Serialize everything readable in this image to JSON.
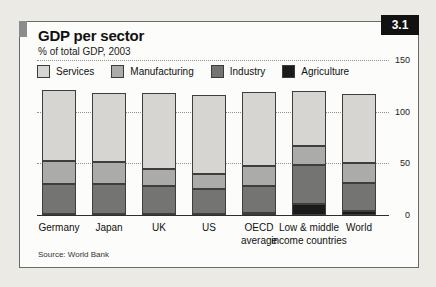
{
  "header": {
    "title": "GDP per sector",
    "subtitle": "% of total GDP, 2003",
    "figure_number": "3.1"
  },
  "source": "Source: World Bank",
  "colors": {
    "services": "#d6d5d1",
    "manufacturing": "#ababa9",
    "industry": "#747472",
    "agriculture": "#1b1b1b",
    "badge_bg": "#111111",
    "accent_tab": "#8c8c8c",
    "gridline": "#909090"
  },
  "chart_data": {
    "type": "bar",
    "stacked": true,
    "title": "GDP per sector",
    "subtitle": "% of total GDP, 2003",
    "ylabel": "% of total GDP",
    "ylim": [
      0,
      150
    ],
    "yticks": [
      0,
      50,
      100,
      150
    ],
    "grid": "dotted horizontal",
    "legend_position": "top-left inside plot",
    "legend_order": [
      "Services",
      "Manufacturing",
      "Industry",
      "Agriculture"
    ],
    "categories": [
      {
        "name": "Germany",
        "lines": [
          "Germany"
        ]
      },
      {
        "name": "Japan",
        "lines": [
          "Japan"
        ]
      },
      {
        "name": "UK",
        "lines": [
          "UK"
        ]
      },
      {
        "name": "US",
        "lines": [
          "US"
        ]
      },
      {
        "name": "OECD average",
        "lines": [
          "OECD",
          "average"
        ]
      },
      {
        "name": "Low & middle income countries",
        "lines": [
          "Low & middle",
          "income countries"
        ]
      },
      {
        "name": "World",
        "lines": [
          "World"
        ]
      }
    ],
    "series": [
      {
        "name": "Agriculture",
        "color": "#1b1b1b",
        "values": [
          1,
          1,
          1,
          1,
          2,
          11,
          4
        ]
      },
      {
        "name": "Industry",
        "color": "#747472",
        "values": [
          29,
          29,
          27,
          24,
          26,
          37,
          27
        ]
      },
      {
        "name": "Manufacturing",
        "color": "#ababa9",
        "values": [
          22,
          21,
          17,
          15,
          19,
          19,
          19
        ]
      },
      {
        "name": "Services",
        "color": "#d6d5d1",
        "values": [
          69,
          67,
          73,
          76,
          72,
          53,
          67
        ]
      }
    ]
  }
}
